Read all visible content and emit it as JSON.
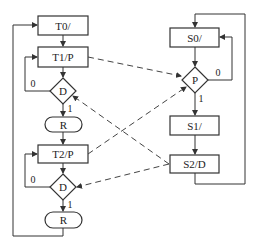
{
  "diagram": {
    "left_chart": {
      "nodes": [
        {
          "id": "T0",
          "label": "T0/",
          "shape": "rect"
        },
        {
          "id": "T1",
          "label": "T1/P",
          "shape": "rect"
        },
        {
          "id": "D1",
          "label": "D",
          "shape": "diamond"
        },
        {
          "id": "R1",
          "label": "R",
          "shape": "oval"
        },
        {
          "id": "T2",
          "label": "T2/P",
          "shape": "rect"
        },
        {
          "id": "D2",
          "label": "D",
          "shape": "diamond"
        },
        {
          "id": "R2",
          "label": "R",
          "shape": "oval"
        }
      ],
      "edge_labels": {
        "d1_false": "0",
        "d1_true": "1",
        "d2_false": "0",
        "d2_true": "1"
      }
    },
    "right_chart": {
      "nodes": [
        {
          "id": "S0",
          "label": "S0/",
          "shape": "rect"
        },
        {
          "id": "P",
          "label": "P",
          "shape": "diamond"
        },
        {
          "id": "S1",
          "label": "S1/",
          "shape": "rect"
        },
        {
          "id": "S2",
          "label": "S2/D",
          "shape": "rect"
        }
      ],
      "edge_labels": {
        "p_false": "0",
        "p_true": "1"
      }
    },
    "dashed_links": [
      {
        "from": "T1",
        "to": "P"
      },
      {
        "from": "T2",
        "to": "P"
      },
      {
        "from": "S2",
        "to": "D1"
      },
      {
        "from": "S2",
        "to": "D2"
      }
    ]
  }
}
